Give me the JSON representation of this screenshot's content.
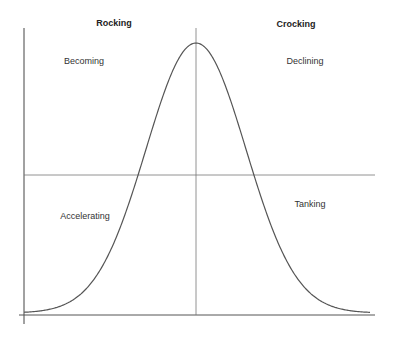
{
  "diagram": {
    "headers": {
      "left": "Rocking",
      "right": "Crocking"
    },
    "quadrants": {
      "top_left": "Becoming",
      "top_right": "Declining",
      "bottom_left": "Accelerating",
      "bottom_right": "Tanking"
    },
    "curve": {
      "shape": "bell",
      "peak_x": 196,
      "peak_y": 43,
      "baseline_y": 313,
      "sigma": 50,
      "x_start": 24,
      "x_end": 370
    },
    "colors": {
      "line": "#555555",
      "text": "#333333",
      "background": "#ffffff"
    }
  }
}
